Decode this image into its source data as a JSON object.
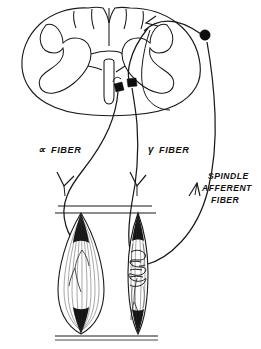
{
  "figure": {
    "style": "black ink line drawing on white",
    "background_color": "#ffffff",
    "ink_color": "#1a1a1a",
    "width": 261,
    "height": 349
  },
  "labels": {
    "alpha_fiber": {
      "greek": "∝",
      "text": "FIBER",
      "full": "α FIBER",
      "x": 38,
      "y": 152
    },
    "gamma_fiber": {
      "greek": "γ",
      "text": "FIBER",
      "full": "γ FIBER",
      "x": 148,
      "y": 152
    },
    "spindle_afferent": {
      "line1": "SPINDLE",
      "line2": "AFFERENT",
      "line3": "FIBER",
      "full": "SPINDLE AFFERENT FIBER",
      "x": 207,
      "y": 182
    }
  },
  "structures": {
    "spinal_cord": {
      "name": "spinal cord cross-section",
      "description": "oval white matter outline with butterfly-shaped central gray matter and ventral median fissure"
    },
    "gray_matter": {
      "name": "gray matter butterfly",
      "description": "H-shaped central gray with dorsal and ventral horns"
    },
    "dorsal_root_ganglion": {
      "name": "dorsal root ganglion cell body",
      "description": "filled black circle on the sensory root",
      "x": 205,
      "y": 35,
      "radius": 5.2
    },
    "alpha_motor_neuron": {
      "name": "alpha motor neuron cell body",
      "description": "filled black soma in the ventral horn",
      "x": 118,
      "y": 88
    },
    "gamma_motor_neuron": {
      "name": "gamma motor neuron cell body",
      "description": "filled black soma in the ventral horn",
      "x": 131,
      "y": 84
    },
    "extrafusal_muscle": {
      "name": "extrafusal muscle fiber",
      "description": "large fusiform striated muscle belly with motor end plate",
      "center_x": 81,
      "top_y": 212,
      "bottom_y": 334
    },
    "intrafusal_spindle": {
      "name": "muscle spindle (intrafusal fibers)",
      "description": "slender fusiform capsule with annulospiral sensory coil wrapping the equator",
      "center_x": 138,
      "top_y": 212,
      "bottom_y": 334
    },
    "tendon_top": {
      "name": "upper tendon attachment",
      "description": "pair of horizontal lines"
    },
    "tendon_bottom": {
      "name": "lower tendon attachment",
      "description": "pair of horizontal lines"
    },
    "annulospiral_ending": {
      "name": "annulospiral sensory ending",
      "description": "tight helical coil around the central region of the spindle"
    }
  },
  "pathways": {
    "alpha_fiber_path": {
      "name": "alpha motor fiber",
      "direction": "efferent",
      "from": "alpha motor neuron in ventral horn",
      "to": "extrafusal muscle fiber",
      "arrow": "downward"
    },
    "gamma_fiber_path": {
      "name": "gamma motor fiber",
      "direction": "efferent",
      "from": "gamma motor neuron in ventral horn",
      "to": "intrafusal spindle fiber",
      "arrow": "downward"
    },
    "afferent_path": {
      "name": "spindle afferent fiber",
      "direction": "afferent",
      "from": "annulospiral ending on muscle spindle",
      "to": "dorsal root ganglion and spinal cord",
      "arrow": "upward"
    },
    "dorsal_entry": {
      "name": "dorsal root entry",
      "direction": "afferent",
      "from": "dorsal root ganglion",
      "to": "dorsal horn of spinal cord",
      "arrow": "leftward into cord"
    }
  }
}
